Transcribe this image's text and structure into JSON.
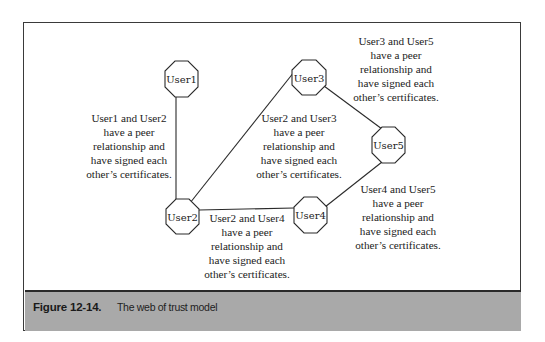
{
  "figure": {
    "label": "Figure 12-14.",
    "title": "The web of trust model"
  },
  "nodes": [
    {
      "id": "User1",
      "label": "User1",
      "cx": 181,
      "cy": 79
    },
    {
      "id": "User2",
      "label": "User2",
      "cx": 182,
      "cy": 217
    },
    {
      "id": "User3",
      "label": "User3",
      "cx": 309,
      "cy": 78
    },
    {
      "id": "User4",
      "label": "User4",
      "cx": 311,
      "cy": 215
    },
    {
      "id": "User5",
      "label": "User5",
      "cx": 388,
      "cy": 145
    }
  ],
  "edges": [
    {
      "from": "User1",
      "to": "User2"
    },
    {
      "from": "User2",
      "to": "User3"
    },
    {
      "from": "User2",
      "to": "User4"
    },
    {
      "from": "User3",
      "to": "User5"
    },
    {
      "from": "User4",
      "to": "User5"
    }
  ],
  "annotations": {
    "user1_user2": [
      "User1 and User2",
      "have a peer",
      "relationship and",
      "have signed each",
      "other’s certificates."
    ],
    "user2_user3": [
      "User2 and User3",
      "have a peer",
      "relationship and",
      "have signed each",
      "other’s certificates."
    ],
    "user3_user5": [
      "User3 and User5",
      "have a peer",
      "relationship and",
      "have signed each",
      "other’s certificates."
    ],
    "user2_user4": [
      "User2 and User4",
      "have a peer",
      "relationship and",
      "have signed each",
      "other’s certificates."
    ],
    "user4_user5": [
      "User4 and User5",
      "have a peer",
      "relationship and",
      "have signed each",
      "other’s certificates."
    ]
  },
  "colors": {
    "line": "#2a2a2a",
    "caption_bg": "#a9a9a9",
    "frame": "#3a3a3a"
  }
}
